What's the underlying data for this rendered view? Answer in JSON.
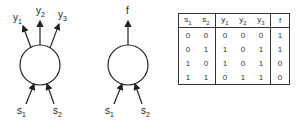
{
  "diagram_left": {
    "outputs": [
      "y1",
      "y2",
      "y3"
    ],
    "inputs": [
      "s1",
      "s2"
    ]
  },
  "diagram_middle": {
    "outputs": [
      "f"
    ],
    "inputs": [
      "s1",
      "s2"
    ]
  },
  "truth_table": {
    "headers": [
      {
        "base": "s",
        "sub": "1"
      },
      {
        "base": "s",
        "sub": "2"
      },
      {
        "base": "y",
        "sub": "1"
      },
      {
        "base": "y",
        "sub": "2"
      },
      {
        "base": "y",
        "sub": "3"
      },
      {
        "base": "f",
        "sub": ""
      }
    ],
    "rows": [
      [
        "0",
        "0",
        "0",
        "0",
        "0",
        "1"
      ],
      [
        "0",
        "1",
        "1",
        "0",
        "1",
        "1"
      ],
      [
        "1",
        "0",
        "1",
        "0",
        "1",
        "0"
      ],
      [
        "1",
        "1",
        "0",
        "1",
        "1",
        "0"
      ]
    ]
  }
}
